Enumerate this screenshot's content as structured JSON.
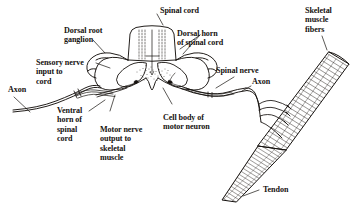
{
  "figure": {
    "ink_color": "#16120f",
    "background_color": "#ffffff",
    "hatch_color": "#2b2420"
  },
  "labels": {
    "spinal_cord": "Spinal cord",
    "dorsal_root_ganglion": "Dorsal root\nganglion",
    "dorsal_horn": "Dorsal horn\nof spinal cord",
    "sensory_nerve_input": "Sensory nerve\ninput to\ncord",
    "axon_left": "Axon",
    "ventral_horn": "Ventral\nhorn of\nspinal\ncord",
    "motor_nerve_output": "Motor nerve\noutput to\nskeletal\nmuscle",
    "cell_body": "Cell body of\nmotor neuron",
    "spinal_nerve": "Spinal nerve",
    "axon_right": "Axon",
    "skeletal_muscle_fibers": "Skeletal\nmuscle\nfibers",
    "tendon": "Tendon"
  }
}
